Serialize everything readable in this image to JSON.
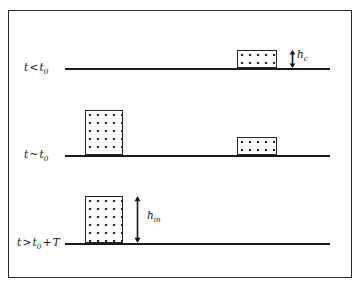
{
  "figure": {
    "kind": "schematic-diagram",
    "frame": {
      "visible": true,
      "color": "#2a2a2a"
    },
    "rows": [
      {
        "id": "row-before",
        "label": {
          "var": "t",
          "op": "<",
          "ref": "t",
          "ref_sub": "0",
          "text": "t < t0"
        },
        "label_x": 24,
        "label_y": 61,
        "baseline": {
          "x": 65,
          "y": 68,
          "width": 265
        },
        "blocks": [
          {
            "name": "block-right",
            "x": 237,
            "y": 50,
            "width": 40,
            "height": 18
          }
        ],
        "dimension": {
          "name": "h-c",
          "symbol": "h",
          "subscript": "c",
          "arrow_x": 288,
          "arrow_y": 50,
          "arrow_height": 18,
          "label_x": 297,
          "label_y": 48
        }
      },
      {
        "id": "row-during",
        "label": {
          "var": "t",
          "op": "~",
          "ref": "t",
          "ref_sub": "0",
          "text": "t ~ t0"
        },
        "label_x": 24,
        "label_y": 148,
        "baseline": {
          "x": 65,
          "y": 155,
          "width": 265
        },
        "blocks": [
          {
            "name": "block-left",
            "x": 85,
            "y": 110,
            "width": 38,
            "height": 45
          },
          {
            "name": "block-right",
            "x": 237,
            "y": 137,
            "width": 40,
            "height": 18
          }
        ],
        "dimension": null
      },
      {
        "id": "row-after",
        "label": {
          "var": "t",
          "op": ">",
          "ref": "t",
          "ref_sub": "0",
          "plus": "+ T",
          "text": "t > t0 + T"
        },
        "label_x": 17,
        "label_y": 236,
        "baseline": {
          "x": 65,
          "y": 243,
          "width": 265
        },
        "blocks": [
          {
            "name": "block-left",
            "x": 85,
            "y": 196,
            "width": 38,
            "height": 47
          }
        ],
        "dimension": {
          "name": "h-in",
          "symbol": "h",
          "subscript": "in",
          "arrow_x": 137,
          "arrow_y": 196,
          "arrow_height": 47,
          "label_x": 147,
          "label_y": 209
        }
      }
    ],
    "colors": {
      "ink": "#1c1c1c",
      "frame": "#2a2a2a",
      "fill_background": "#ffffff",
      "fill_dots": "#1f1f1f"
    }
  }
}
